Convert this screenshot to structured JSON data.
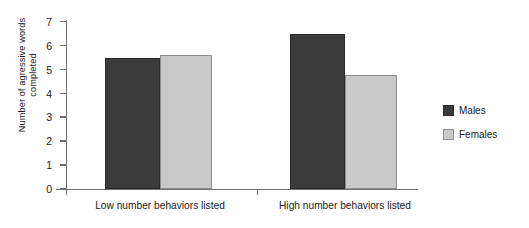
{
  "chart_data": {
    "type": "bar",
    "title": "",
    "xlabel": "",
    "ylabel": "Number of agressive words completed",
    "ylabel_line1": "Number of agressive words",
    "ylabel_line2": "completed",
    "categories": [
      "Low number behaviors listed",
      "High number behaviors listed"
    ],
    "series": [
      {
        "name": "Males",
        "values": [
          5.5,
          6.5
        ],
        "color": "#3b3b3b"
      },
      {
        "name": "Females",
        "values": [
          5.6,
          4.8
        ],
        "color": "#c9c9c9"
      }
    ],
    "ylim": [
      0,
      7
    ],
    "ytick_labels": [
      "7",
      "6",
      "5",
      "4",
      "3",
      "2",
      "1",
      "0"
    ],
    "ytick_values": [
      7,
      6,
      5,
      4,
      3,
      2,
      1,
      0
    ],
    "grid": false,
    "legend_position": "right",
    "legend_entries": [
      "Males",
      "Females"
    ]
  },
  "legend": {
    "items": [
      {
        "label": "Males",
        "color": "#3b3b3b"
      },
      {
        "label": "Females",
        "color": "#c9c9c9"
      }
    ]
  },
  "axes": {
    "y_title_line1": "Number of agressive words",
    "y_title_line2": "completed",
    "y_ticks": [
      "7",
      "6",
      "5",
      "4",
      "3",
      "2",
      "1",
      "0"
    ],
    "x_categories": [
      "Low number behaviors listed",
      "High number behaviors listed"
    ]
  },
  "colors": {
    "males": "#3b3b3b",
    "females": "#c9c9c9",
    "axis": "#6f6f6f",
    "text": "#1a1a1a",
    "background": "#ffffff"
  }
}
